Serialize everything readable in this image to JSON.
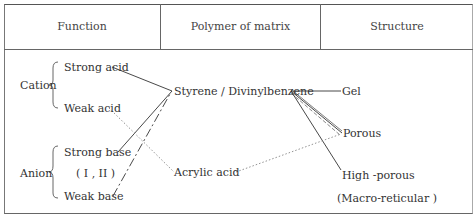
{
  "caption": "Fig. — Ion exchange resin composition",
  "header": {
    "columns": [
      "Function",
      "Polymer of matrix",
      "Structure"
    ]
  },
  "function": {
    "cation": {
      "label": "Cation",
      "items": [
        "Strong acid",
        "Weak acid"
      ]
    },
    "anion": {
      "label": "Anion",
      "items": [
        "Strong base",
        "( I , II )",
        "Weak base"
      ]
    }
  },
  "matrix": {
    "items": [
      "Styrene / Divinylbenzene",
      "Acrylic acid"
    ]
  },
  "structure": {
    "items": [
      "Gel",
      "Porous",
      "High -porous",
      "(Macro-reticular )"
    ]
  },
  "connections": [
    {
      "from": "Strong acid",
      "to": "Styrene / Divinylbenzene",
      "style": "solid"
    },
    {
      "from": "Strong base",
      "to": "Styrene / Divinylbenzene",
      "style": "solid"
    },
    {
      "from": "Weak base",
      "to": "Styrene / Divinylbenzene",
      "style": "dash-dot"
    },
    {
      "from": "Weak acid",
      "to": "Acrylic acid",
      "style": "dotted"
    },
    {
      "from": "Styrene / Divinylbenzene",
      "to": "Gel",
      "style": "solid"
    },
    {
      "from": "Styrene / Divinylbenzene",
      "to": "Porous",
      "style": "solid"
    },
    {
      "from": "Styrene / Divinylbenzene",
      "to": "Porous",
      "style": "dashed"
    },
    {
      "from": "Styrene / Divinylbenzene",
      "to": "High -porous",
      "style": "solid"
    },
    {
      "from": "Acrylic acid",
      "to": "Porous",
      "style": "dotted"
    }
  ]
}
